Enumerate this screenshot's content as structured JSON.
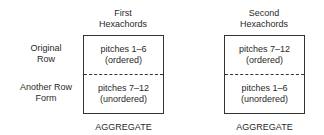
{
  "left": {
    "header": [
      "First",
      "Hexachords"
    ],
    "top_cell": [
      "pitches 1–6",
      "(ordered)"
    ],
    "bottom_cell": [
      "pitches 7–12",
      "(unordered)"
    ],
    "footer": "AGGREGATE"
  },
  "right": {
    "header": [
      "Second",
      "Hexachords"
    ],
    "top_cell": [
      "pitches 7–12",
      "(ordered)"
    ],
    "bottom_cell": [
      "pitches 1–6",
      "(unordered)"
    ],
    "footer": "AGGREGATE"
  },
  "row_labels": {
    "row1": [
      "Original",
      "Row"
    ],
    "row2": [
      "Another Row",
      "Form"
    ]
  }
}
